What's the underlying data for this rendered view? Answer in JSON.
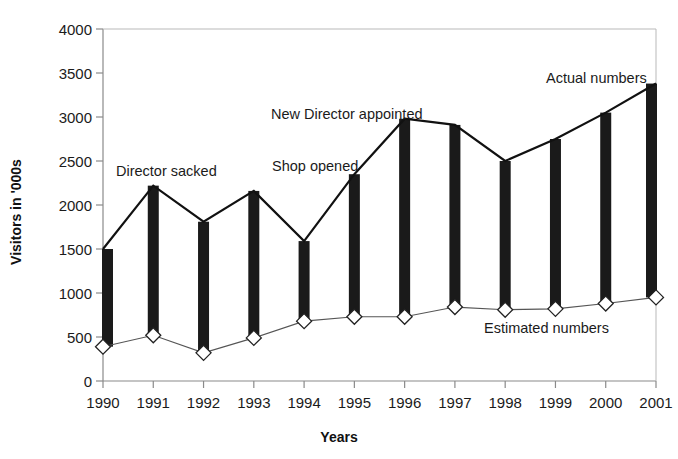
{
  "chart_data": {
    "type": "line",
    "title": "",
    "subtitle": "",
    "xlabel": "Years",
    "ylabel": "Visitors in '000s",
    "categories": [
      "1990",
      "1991",
      "1992",
      "1993",
      "1994",
      "1995",
      "1996",
      "1997",
      "1998",
      "1999",
      "2000",
      "2001"
    ],
    "xlim": [
      1990,
      2001
    ],
    "ylim": [
      0,
      4000
    ],
    "yticks": [
      0,
      500,
      1000,
      1500,
      2000,
      2500,
      3000,
      3500,
      4000
    ],
    "ytick_labels": [
      "0",
      "500",
      "1000",
      "1500",
      "2000",
      "2500",
      "3000",
      "3500",
      "4000"
    ],
    "grid": false,
    "legend_position": "inline-annotations",
    "series": [
      {
        "name": "Actual numbers",
        "marker": "none",
        "line_color": "#111111",
        "line_width": 2.2,
        "values": [
          1500,
          2220,
          1810,
          2160,
          1590,
          2350,
          2980,
          2910,
          2500,
          2750,
          3050,
          3380
        ]
      },
      {
        "name": "Estimated numbers",
        "marker": "diamond",
        "line_color": "#555555",
        "line_width": 1.1,
        "values": [
          390,
          520,
          320,
          490,
          680,
          730,
          730,
          840,
          810,
          820,
          880,
          950
        ]
      }
    ],
    "bars": {
      "description": "vertical black bars connecting Estimated to Actual at each year",
      "color": "#1a1a1a",
      "width_px": 11
    },
    "annotations": [
      {
        "text": "Director sacked",
        "x_px": 116,
        "y_px": 163
      },
      {
        "text": "Shop opened",
        "x_px": 272,
        "y_px": 158
      },
      {
        "text": "New Director appointed",
        "x_px": 271,
        "y_px": 106
      },
      {
        "text": "Actual numbers",
        "x_px": 546,
        "y_px": 70
      },
      {
        "text": "Estimated numbers",
        "x_px": 484,
        "y_px": 320
      }
    ]
  },
  "axes": {
    "plot_left_px": 103,
    "plot_right_px": 656,
    "plot_top_px": 29,
    "plot_bottom_px": 381,
    "axis_color": "#8a8a8a"
  }
}
